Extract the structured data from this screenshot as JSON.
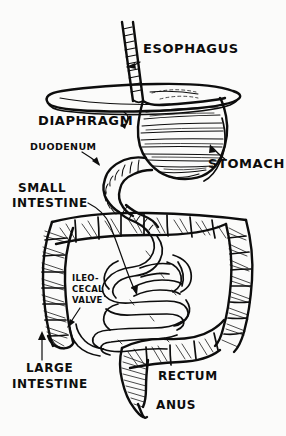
{
  "figure": {
    "style": "hand-drawn black ink line art",
    "width": 286,
    "height": 436,
    "background_color": "#fbfbfa",
    "ink_color": "#0d0d0d"
  },
  "labels": [
    {
      "id": "esophagus",
      "text": "ESOPHAGUS",
      "x": 143,
      "y": 53,
      "size": "lg",
      "anchor": "start",
      "pointer": "arrow"
    },
    {
      "id": "diaphragm",
      "text": "DIAPHRAGM",
      "x": 38,
      "y": 125,
      "size": "lg",
      "anchor": "start",
      "pointer": "hook"
    },
    {
      "id": "duodenum",
      "text": "DUODENUM",
      "x": 30,
      "y": 150,
      "size": "sm",
      "anchor": "start",
      "pointer": "arrow"
    },
    {
      "id": "stomach",
      "text": "STOMACH",
      "x": 208,
      "y": 168,
      "size": "lg",
      "anchor": "start",
      "pointer": "arrow"
    },
    {
      "id": "small-intestine-line1",
      "text": "SMALL",
      "x": 18,
      "y": 192,
      "size": "md",
      "anchor": "start",
      "pointer": "line"
    },
    {
      "id": "small-intestine-line2",
      "text": "INTESTINE",
      "x": 12,
      "y": 207,
      "size": "md",
      "anchor": "start",
      "pointer": "line"
    },
    {
      "id": "ileocecal-valve-line1",
      "text": "ILEO-",
      "x": 72,
      "y": 281,
      "size": "xs",
      "anchor": "start",
      "pointer": "arrow"
    },
    {
      "id": "ileocecal-valve-line2",
      "text": "CECAL",
      "x": 72,
      "y": 292,
      "size": "xs",
      "anchor": "start",
      "pointer": "arrow"
    },
    {
      "id": "ileocecal-valve-line3",
      "text": "VALVE",
      "x": 72,
      "y": 303,
      "size": "xs",
      "anchor": "start",
      "pointer": "arrow"
    },
    {
      "id": "large-intestine-line1",
      "text": "LARGE",
      "x": 26,
      "y": 372,
      "size": "md",
      "anchor": "start",
      "pointer": "arrow"
    },
    {
      "id": "large-intestine-line2",
      "text": "INTESTINE",
      "x": 12,
      "y": 388,
      "size": "md",
      "anchor": "start",
      "pointer": "arrow"
    },
    {
      "id": "rectum",
      "text": "RECTUM",
      "x": 158,
      "y": 380,
      "size": "md",
      "anchor": "start",
      "pointer": "none"
    },
    {
      "id": "anus",
      "text": "ANUS",
      "x": 156,
      "y": 409,
      "size": "md",
      "anchor": "start",
      "pointer": "none"
    }
  ],
  "organs": [
    {
      "id": "esophagus-tube",
      "name": "Esophagus",
      "description": "vertical ridged tube descending from top, slightly tilted"
    },
    {
      "id": "diaphragm-sheet",
      "name": "Diaphragm",
      "description": "wide flat horizontal ellipse sheet beneath esophagus"
    },
    {
      "id": "stomach-sac",
      "name": "Stomach",
      "description": "large J-shaped sac with horizontal rugae hatch lines"
    },
    {
      "id": "duodenum-curve",
      "name": "Duodenum",
      "description": "ringed C-shaped tube leaving stomach pylorus"
    },
    {
      "id": "small-intestine-coils",
      "name": "Small intestine",
      "description": "coiled smooth loops filling central abdomen"
    },
    {
      "id": "large-intestine-frame",
      "name": "Large intestine",
      "description": "haustrated colon forming inverted-U frame, cross-hatched segments"
    },
    {
      "id": "ileocecal-valve-point",
      "name": "Ileocecal valve",
      "description": "junction of ileum into cecum at lower left"
    },
    {
      "id": "rectum-segment",
      "name": "Rectum",
      "description": "shaded terminal segment descending at bottom center"
    },
    {
      "id": "anus-opening",
      "name": "Anus",
      "description": "narrow tapered opening at the very bottom"
    }
  ]
}
